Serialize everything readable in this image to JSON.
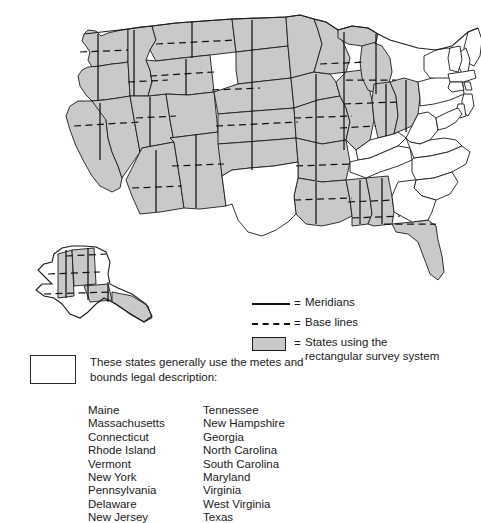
{
  "figure": {
    "name": "us-public-land-survey-system-map",
    "background_color": "#ffffff"
  },
  "map": {
    "name": "united-states-map",
    "shaded_fill_color": "#c9c9c9",
    "plain_fill_color": "#ffffff",
    "line_color": "#111111",
    "includes_alaska_inset": true
  },
  "legend": {
    "name": "map-legend",
    "entries": [
      {
        "key": "solid-line",
        "equals": "=",
        "label": "Meridians"
      },
      {
        "key": "dashed-line",
        "equals": "=",
        "label": "Base lines"
      },
      {
        "key": "gray-swatch",
        "equals": "=",
        "label": "States using the\nrectangular survey system"
      }
    ]
  },
  "metes_and_bounds": {
    "name": "metes-and-bounds-note",
    "swatch_fill": "#ffffff",
    "description": "These states generally use the metes and\nbounds legal description:",
    "columns": [
      {
        "name": "metes-bounds-column-left",
        "states": [
          "Maine",
          "Massachusetts",
          "Connecticut",
          "Rhode Island",
          "Vermont",
          "New York",
          "Pennsylvania",
          "Delaware",
          "New Jersey"
        ]
      },
      {
        "name": "metes-bounds-column-right",
        "states": [
          "Tennessee",
          "New Hampshire",
          "Georgia",
          "North Carolina",
          "South Carolina",
          "Maryland",
          "Virginia",
          "West Virginia",
          "Texas"
        ]
      }
    ]
  }
}
